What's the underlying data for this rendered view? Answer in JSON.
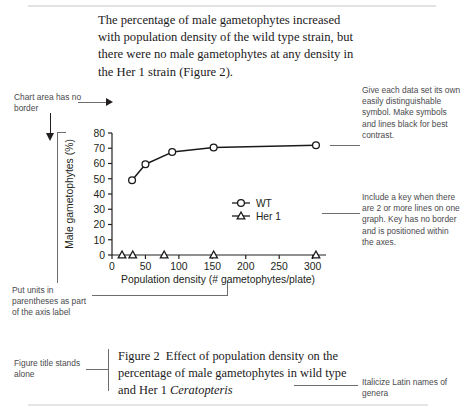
{
  "intro_paragraph": "The percentage of male gametophytes increased with population density of the wild type strain, but there were no male gametophytes at any density in the Her 1 strain (Figure 2).",
  "annotations": {
    "chart_area_no_border": "Chart area has no border",
    "units_in_parentheses": "Put units in parentheses as part of the axis label",
    "figure_title_stands_alone": "Figure title stands alone",
    "distinguishable_symbols": "Give each data set its own easily distinguishable symbol. Make symbols and lines black for best contrast.",
    "include_a_key": "Include a key when there are 2 or more lines on one graph. Key has no border and is positioned within the axes.",
    "italicize_latin": "Italicize Latin names of genera"
  },
  "caption": {
    "prefix": "Figure 2",
    "text_before_italic": "Effect of population density on the percentage of male gametophytes in wild type and Her 1",
    "italic_term": "Ceratopteris"
  },
  "chart_data": {
    "type": "line",
    "title": "",
    "xlabel": "Population density (# gametophytes/plate)",
    "ylabel": "Male gametophytes (%)",
    "xlim": [
      0,
      320
    ],
    "ylim": [
      0,
      80
    ],
    "xticks": [
      0,
      50,
      100,
      150,
      200,
      250,
      300
    ],
    "yticks": [
      0,
      10,
      20,
      30,
      40,
      50,
      60,
      70,
      80
    ],
    "grid": false,
    "legend_position": "inside-lower-right",
    "series": [
      {
        "name": "WT",
        "marker": "circle",
        "color": "#1a1a1a",
        "points": [
          {
            "x": 30,
            "y": 49
          },
          {
            "x": 50,
            "y": 59.5
          },
          {
            "x": 90,
            "y": 67.5
          },
          {
            "x": 152,
            "y": 70.5
          },
          {
            "x": 305,
            "y": 72
          }
        ]
      },
      {
        "name": "Her 1",
        "marker": "triangle",
        "color": "#1a1a1a",
        "points": [
          {
            "x": 15,
            "y": 0
          },
          {
            "x": 31,
            "y": 0
          },
          {
            "x": 78,
            "y": 0
          },
          {
            "x": 152,
            "y": 0
          },
          {
            "x": 305,
            "y": 0
          }
        ]
      }
    ]
  }
}
